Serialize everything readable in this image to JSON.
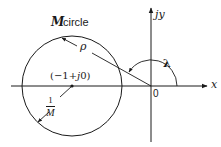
{
  "diagram": {
    "title_italic_part": "M",
    "title_rest": " circle",
    "labels": {
      "radius": "ρ",
      "center": "(−1+j0)",
      "center_part1": "(−1+",
      "center_j": "j",
      "center_part2": "0)",
      "radius_formula_num": "1",
      "radius_formula_den": "M",
      "origin": "0",
      "x_axis": "x",
      "y_axis": "jy",
      "angle": "λ"
    },
    "geometry": {
      "origin": [
        151,
        86
      ],
      "circle_center": [
        72,
        86
      ],
      "circle_radius": 50,
      "angle_arc_radius": 26
    },
    "colors": {
      "stroke": "#1a1a1a",
      "background": "#ffffff"
    }
  }
}
